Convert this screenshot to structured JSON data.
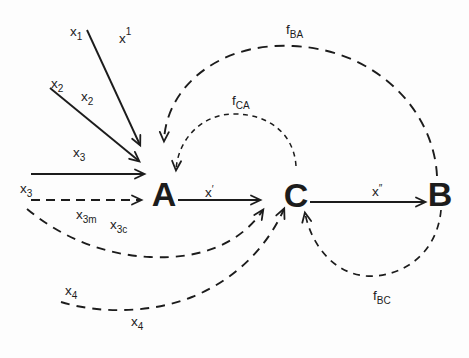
{
  "diagram": {
    "colors": {
      "ink": "#1c1c1c",
      "background": "#fdfdfd"
    },
    "nodes": [
      {
        "id": "A",
        "label": "A"
      },
      {
        "id": "C",
        "label": "C"
      },
      {
        "id": "B",
        "label": "B"
      }
    ],
    "labels": {
      "x1": {
        "base": "x",
        "sub": "1"
      },
      "x1_sup": {
        "base": "x",
        "sup": "1"
      },
      "x2_outer": {
        "base": "x",
        "sub": "2"
      },
      "x2_inner": {
        "base": "x",
        "sub": "2"
      },
      "x3_solid": {
        "base": "x",
        "sub": "3"
      },
      "x3_dashed": {
        "base": "x",
        "sub": "3"
      },
      "x3m": {
        "base": "x",
        "sub": "3m"
      },
      "x3c": {
        "base": "x",
        "sub": "3c"
      },
      "x4_upper": {
        "base": "x",
        "sub": "4"
      },
      "x4_lower": {
        "base": "x",
        "sub": "4"
      },
      "x_prime": {
        "base": "x",
        "sup": "′"
      },
      "x_double_prime": {
        "base": "x",
        "sup": "″"
      },
      "f_BA": {
        "base": "f",
        "sub": "BA"
      },
      "f_CA": {
        "base": "f",
        "sub": "CA"
      },
      "f_BC": {
        "base": "f",
        "sub": "BC"
      }
    }
  }
}
